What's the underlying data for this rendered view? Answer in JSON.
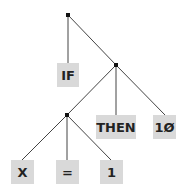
{
  "tree": {
    "title": "",
    "nodes": [
      {
        "id": "root",
        "label": "",
        "type": "internal"
      },
      {
        "id": "if",
        "label": "IF",
        "type": "leaf",
        "parent": "root"
      },
      {
        "id": "n2",
        "label": "",
        "type": "internal",
        "parent": "root"
      },
      {
        "id": "n3",
        "label": "",
        "type": "internal",
        "parent": "n2"
      },
      {
        "id": "then",
        "label": "THEN",
        "type": "leaf",
        "parent": "n2"
      },
      {
        "id": "ten",
        "label": "1Ø",
        "type": "leaf",
        "parent": "n2"
      },
      {
        "id": "x",
        "label": "X",
        "type": "leaf",
        "parent": "n3"
      },
      {
        "id": "eq",
        "label": "=",
        "type": "leaf",
        "parent": "n3"
      },
      {
        "id": "one",
        "label": "1",
        "type": "leaf",
        "parent": "n3"
      }
    ]
  },
  "labels": {
    "if": "IF",
    "then": "THEN",
    "ten": "1Ø",
    "x": "X",
    "eq": "=",
    "one": "1"
  }
}
